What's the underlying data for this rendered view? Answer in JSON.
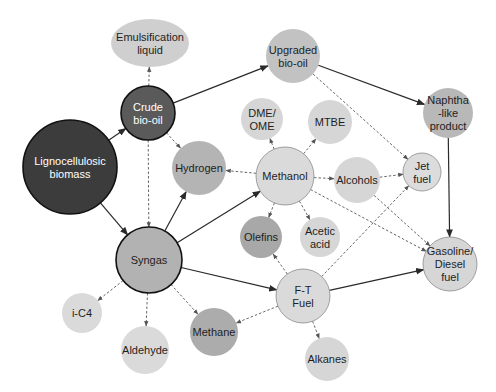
{
  "diagram": {
    "colors": {
      "very_dark": "#3a3a3a",
      "dark": "#5c5c5c",
      "medium": "#a8a8a8",
      "medium_light": "#c4c4c4",
      "light": "#d9d9d9",
      "stroke_dark": "#111111",
      "stroke_light": "#8a8a8a"
    },
    "nodes": [
      {
        "id": "emulsification",
        "lines": [
          "Emulsification",
          "liquid"
        ],
        "shape": "ellipse",
        "cx": 150,
        "cy": 43,
        "rx": 39,
        "ry": 24,
        "fill": "#cfcfcf",
        "stroke": "none",
        "text": "dark"
      },
      {
        "id": "crude_bio_oil",
        "lines": [
          "Crude",
          "bio-oil"
        ],
        "shape": "circle",
        "cx": 148,
        "cy": 113,
        "r": 27,
        "fill": "#5a5a5a",
        "stroke": "#111111",
        "text": "light"
      },
      {
        "id": "lignocellulosic_biomass",
        "lines": [
          "Lignocellulosic",
          "biomass"
        ],
        "shape": "circle",
        "cx": 70,
        "cy": 167,
        "r": 47,
        "fill": "#3c3c3c",
        "stroke": "#111111",
        "text": "light"
      },
      {
        "id": "hydrogen",
        "lines": [
          "Hydrogen"
        ],
        "shape": "circle",
        "cx": 199,
        "cy": 168,
        "r": 27,
        "fill": "#b4b4b4",
        "stroke": "none",
        "text": "dark"
      },
      {
        "id": "upgraded_bio_oil",
        "lines": [
          "Upgraded",
          "bio-oil"
        ],
        "shape": "circle",
        "cx": 293,
        "cy": 56,
        "r": 27,
        "fill": "#c2c2c2",
        "stroke": "none",
        "text": "dark"
      },
      {
        "id": "dme_ome",
        "lines": [
          "DME/",
          "OME"
        ],
        "shape": "circle",
        "cx": 262,
        "cy": 119,
        "r": 21,
        "fill": "#d6d6d6",
        "stroke": "none",
        "text": "dark"
      },
      {
        "id": "mtbe",
        "lines": [
          "MTBE"
        ],
        "shape": "circle",
        "cx": 330,
        "cy": 122,
        "r": 22,
        "fill": "#d6d6d6",
        "stroke": "none",
        "text": "dark"
      },
      {
        "id": "methanol",
        "lines": [
          "Methanol"
        ],
        "shape": "circle",
        "cx": 285,
        "cy": 176,
        "r": 29,
        "fill": "#dadada",
        "stroke": "#8a8a8a",
        "text": "dark"
      },
      {
        "id": "alcohols",
        "lines": [
          "Alcohols"
        ],
        "shape": "circle",
        "cx": 357,
        "cy": 180,
        "r": 23,
        "fill": "#d6d6d6",
        "stroke": "none",
        "text": "dark"
      },
      {
        "id": "jet_fuel",
        "lines": [
          "Jet",
          "fuel"
        ],
        "shape": "circle",
        "cx": 422,
        "cy": 172,
        "r": 19,
        "fill": "#dcdcdc",
        "stroke": "#8a8a8a",
        "text": "dark"
      },
      {
        "id": "naphtha",
        "lines": [
          "Naphtha",
          "-like",
          "product"
        ],
        "shape": "circle",
        "cx": 448,
        "cy": 113,
        "r": 25,
        "fill": "#b8b8b8",
        "stroke": "none",
        "text": "dark"
      },
      {
        "id": "olefins",
        "lines": [
          "Olefins"
        ],
        "shape": "circle",
        "cx": 261,
        "cy": 237,
        "r": 21,
        "fill": "#a8a8a8",
        "stroke": "none",
        "text": "dark"
      },
      {
        "id": "acetic_acid",
        "lines": [
          "Acetic",
          "acid"
        ],
        "shape": "circle",
        "cx": 320,
        "cy": 237,
        "r": 20,
        "fill": "#d6d6d6",
        "stroke": "none",
        "text": "dark"
      },
      {
        "id": "syngas",
        "lines": [
          "Syngas"
        ],
        "shape": "circle",
        "cx": 149,
        "cy": 260,
        "r": 33,
        "fill": "#b2b2b2",
        "stroke": "#111111",
        "text": "dark"
      },
      {
        "id": "gasoline_diesel",
        "lines": [
          "Gasoline/",
          "Diesel",
          "fuel"
        ],
        "shape": "circle",
        "cx": 450,
        "cy": 264,
        "r": 27,
        "fill": "#d6d6d6",
        "stroke": "#8a8a8a",
        "text": "dark"
      },
      {
        "id": "ft_fuel",
        "lines": [
          "F-T",
          "Fuel"
        ],
        "shape": "circle",
        "cx": 303,
        "cy": 296,
        "r": 27,
        "fill": "#dadada",
        "stroke": "#8a8a8a",
        "text": "dark"
      },
      {
        "id": "i_c4",
        "lines": [
          "i-C4"
        ],
        "shape": "circle",
        "cx": 82,
        "cy": 313,
        "r": 20,
        "fill": "#dadada",
        "stroke": "none",
        "text": "dark"
      },
      {
        "id": "aldehyde",
        "lines": [
          "Aldehyde"
        ],
        "shape": "circle",
        "cx": 145,
        "cy": 350,
        "r": 24,
        "fill": "#dadada",
        "stroke": "none",
        "text": "dark"
      },
      {
        "id": "methane",
        "lines": [
          "Methane"
        ],
        "shape": "circle",
        "cx": 214,
        "cy": 332,
        "r": 24,
        "fill": "#acacac",
        "stroke": "none",
        "text": "dark"
      },
      {
        "id": "alkanes",
        "lines": [
          "Alkanes"
        ],
        "shape": "circle",
        "cx": 327,
        "cy": 359,
        "r": 22,
        "fill": "#d6d6d6",
        "stroke": "none",
        "text": "dark"
      }
    ],
    "edges": [
      {
        "from": "lignocellulosic_biomass",
        "to": "crude_bio_oil",
        "style": "solid"
      },
      {
        "from": "lignocellulosic_biomass",
        "to": "syngas",
        "style": "solid"
      },
      {
        "from": "crude_bio_oil",
        "to": "emulsification",
        "style": "dashed"
      },
      {
        "from": "crude_bio_oil",
        "to": "upgraded_bio_oil",
        "style": "solid"
      },
      {
        "from": "crude_bio_oil",
        "to": "hydrogen",
        "style": "dashed"
      },
      {
        "from": "crude_bio_oil",
        "to": "syngas",
        "style": "dashed"
      },
      {
        "from": "upgraded_bio_oil",
        "to": "naphtha",
        "style": "solid"
      },
      {
        "from": "upgraded_bio_oil",
        "to": "jet_fuel",
        "style": "dashed"
      },
      {
        "from": "naphtha",
        "to": "gasoline_diesel",
        "style": "solid"
      },
      {
        "from": "syngas",
        "to": "hydrogen",
        "style": "solid"
      },
      {
        "from": "syngas",
        "to": "methanol",
        "style": "solid"
      },
      {
        "from": "syngas",
        "to": "ft_fuel",
        "style": "solid"
      },
      {
        "from": "syngas",
        "to": "i_c4",
        "style": "dashed"
      },
      {
        "from": "syngas",
        "to": "aldehyde",
        "style": "dashed"
      },
      {
        "from": "syngas",
        "to": "methane",
        "style": "dashed"
      },
      {
        "from": "methanol",
        "to": "hydrogen",
        "style": "dashed"
      },
      {
        "from": "methanol",
        "to": "dme_ome",
        "style": "dashed"
      },
      {
        "from": "methanol",
        "to": "mtbe",
        "style": "dashed"
      },
      {
        "from": "methanol",
        "to": "alcohols",
        "style": "dashed"
      },
      {
        "from": "methanol",
        "to": "olefins",
        "style": "dashed"
      },
      {
        "from": "methanol",
        "to": "acetic_acid",
        "style": "dashed"
      },
      {
        "from": "methanol",
        "to": "gasoline_diesel",
        "style": "dashed"
      },
      {
        "from": "alcohols",
        "to": "jet_fuel",
        "style": "dashed"
      },
      {
        "from": "alcohols",
        "to": "gasoline_diesel",
        "style": "dashed"
      },
      {
        "from": "ft_fuel",
        "to": "gasoline_diesel",
        "style": "solid"
      },
      {
        "from": "ft_fuel",
        "to": "jet_fuel",
        "style": "dashed"
      },
      {
        "from": "ft_fuel",
        "to": "olefins",
        "style": "dashed"
      },
      {
        "from": "ft_fuel",
        "to": "methane",
        "style": "dashed"
      },
      {
        "from": "ft_fuel",
        "to": "alkanes",
        "style": "dashed"
      }
    ]
  }
}
